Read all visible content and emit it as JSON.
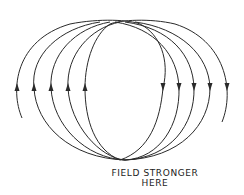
{
  "diagram": {
    "caption": {
      "line1": "FIELD STRONGER",
      "line2": "HERE"
    },
    "colors": {
      "line": "#2a2a2a",
      "background": "#ffffff"
    },
    "loops": [
      {
        "left_x": 17,
        "right_x": 163
      },
      {
        "left_x": 34,
        "right_x": 179
      },
      {
        "left_x": 51,
        "right_x": 194
      },
      {
        "left_x": 68,
        "right_x": 210
      },
      {
        "left_x": 85,
        "right_x": 227
      }
    ],
    "arrows": {
      "left_direction": "up",
      "right_direction": "down"
    }
  }
}
